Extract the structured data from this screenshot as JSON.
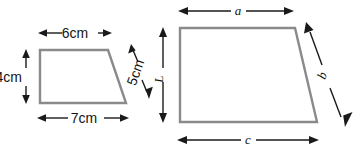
{
  "diagram": {
    "background_color": "#ffffff",
    "shape_stroke_color": "#8a8a8a",
    "label_color": "#141414",
    "shapes": [
      {
        "name": "small-trapezoid",
        "points": "40,50 108,50 126,103 40,103",
        "labels": [
          "6cm",
          "4cm",
          "7cm",
          "5cm"
        ]
      },
      {
        "name": "large-trapezoid",
        "points": "180,28 295,28 317,122 180,122",
        "labels": [
          "a",
          "L",
          "c",
          "b"
        ]
      }
    ],
    "dimensions": {
      "small_top": "6cm",
      "small_left": "4cm",
      "small_bottom": "7cm",
      "small_slant": "5cm",
      "large_top": "a",
      "large_left": "L",
      "large_bottom": "c",
      "large_slant": "b"
    }
  }
}
